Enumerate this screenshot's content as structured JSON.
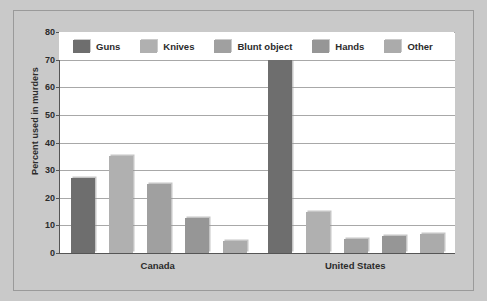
{
  "chart_data": {
    "type": "bar",
    "title": "",
    "xlabel": "",
    "ylabel": "Percent used in murders",
    "ylim": [
      0,
      80
    ],
    "ytick_step": 10,
    "yticks": [
      "80",
      "70",
      "60",
      "50",
      "40",
      "30",
      "20",
      "10",
      "0"
    ],
    "grid": true,
    "legend_position": "top-inside",
    "categories": [
      "Canada",
      "United States"
    ],
    "series": [
      {
        "name": "Guns",
        "color": "#6e6e6e",
        "values": [
          27,
          70
        ]
      },
      {
        "name": "Knives",
        "color": "#b0b0b0",
        "values": [
          35,
          15
        ]
      },
      {
        "name": "Blunt object",
        "color": "#a0a0a0",
        "values": [
          25,
          5
        ]
      },
      {
        "name": "Hands",
        "color": "#969696",
        "values": [
          12.5,
          6
        ]
      },
      {
        "name": "Other",
        "color": "#ababab",
        "values": [
          4.5,
          7
        ]
      }
    ]
  },
  "colors": {
    "page_background": "#c9c9c9",
    "plot_background": "#ffffff",
    "frame_border": "#9a9a9a",
    "axis": "#555555",
    "gridline": "#a8a8a8",
    "text": "#2b2b2b"
  }
}
